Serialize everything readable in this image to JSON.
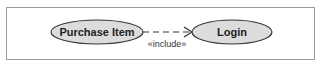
{
  "diagram": {
    "type": "uml-use-case",
    "use_cases": [
      {
        "id": "purchase-item",
        "label": "Purchase Item"
      },
      {
        "id": "login",
        "label": "Login"
      }
    ],
    "relationships": [
      {
        "from": "purchase-item",
        "to": "login",
        "kind": "dependency",
        "stereotype": "«include»"
      }
    ],
    "colors": {
      "ellipse_fill": "#dcdcdc",
      "ellipse_stroke": "#333333",
      "frame_stroke": "#9a9a9a",
      "text": "#222222"
    }
  }
}
